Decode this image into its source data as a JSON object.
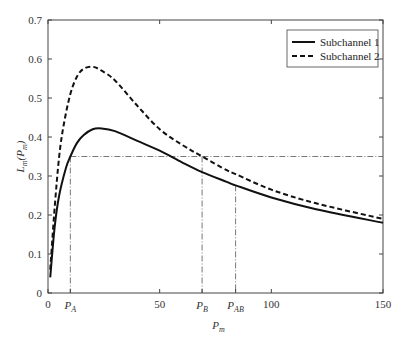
{
  "chart_data": {
    "type": "line",
    "title": "",
    "xlabel": "P_m",
    "ylabel": "L_m(P_m)",
    "xlim": [
      0,
      150
    ],
    "ylim": [
      0,
      0.7
    ],
    "grid": false,
    "legend_position": "upper right",
    "x_ticks": [
      "0",
      "50",
      "100",
      "150"
    ],
    "y_ticks": [
      "0",
      "0.1",
      "0.2",
      "0.3",
      "0.4",
      "0.5",
      "0.6",
      "0.7"
    ],
    "x_annotations": [
      {
        "label": "P",
        "sub": "A",
        "x": 10
      },
      {
        "label": "P",
        "sub": "B",
        "x": 69
      },
      {
        "label": "P",
        "sub": "AB",
        "x": 84
      }
    ],
    "threshold": {
      "y": 0.35,
      "style": "dash-dot"
    },
    "series": [
      {
        "name": "Subchannel 1",
        "style": "solid",
        "x": [
          1,
          3,
          5,
          8,
          10,
          13,
          16,
          20,
          24,
          30,
          40,
          50,
          60,
          69,
          80,
          84,
          100,
          120,
          150
        ],
        "y": [
          0.04,
          0.17,
          0.25,
          0.32,
          0.35,
          0.385,
          0.405,
          0.42,
          0.422,
          0.415,
          0.39,
          0.365,
          0.335,
          0.31,
          0.285,
          0.276,
          0.245,
          0.215,
          0.18
        ]
      },
      {
        "name": "Subchannel 2",
        "style": "dashed",
        "x": [
          1,
          3,
          5,
          7,
          10,
          13,
          16,
          20,
          24,
          30,
          40,
          50,
          60,
          69,
          80,
          84,
          100,
          120,
          150
        ],
        "y": [
          0.06,
          0.22,
          0.35,
          0.43,
          0.51,
          0.555,
          0.575,
          0.58,
          0.57,
          0.545,
          0.48,
          0.42,
          0.38,
          0.35,
          0.315,
          0.305,
          0.265,
          0.23,
          0.19
        ]
      }
    ]
  },
  "legend": {
    "items": [
      {
        "label": "Subchannel 1"
      },
      {
        "label": "Subchannel 2"
      }
    ]
  },
  "axes": {
    "xlabel_main": "P",
    "xlabel_sub": "m",
    "ylabel_main": "L",
    "ylabel_sub": "m",
    "ylabel_arg_main": "(P",
    "ylabel_arg_sub": "m",
    "ylabel_close": ")"
  }
}
